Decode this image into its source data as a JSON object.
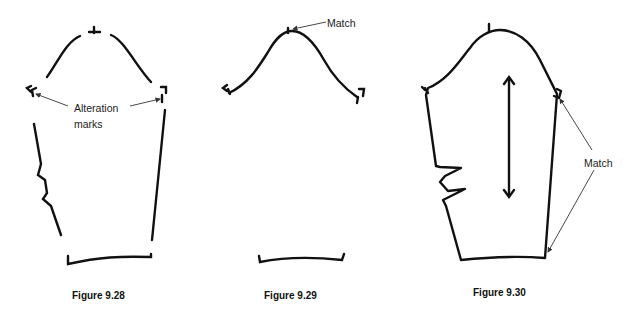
{
  "figures": [
    {
      "caption": "Figure 9.28",
      "annotation": {
        "line1": "Alteration",
        "line2": "marks"
      }
    },
    {
      "caption": "Figure 9.29",
      "annotation": {
        "line1": "Match"
      }
    },
    {
      "caption": "Figure 9.30",
      "annotation": {
        "line1": "Match"
      }
    }
  ]
}
